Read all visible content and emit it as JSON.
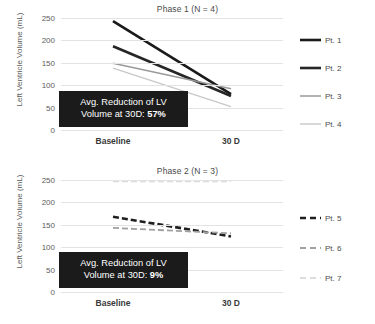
{
  "chart_data": [
    {
      "type": "line",
      "title": "Phase 1 (N = 4)",
      "xlabel": "",
      "ylabel": "Left Ventricle Volume (mL)",
      "categories": [
        "Baseline",
        "30 D"
      ],
      "ylim": [
        0,
        250
      ],
      "yticks": [
        0,
        50,
        100,
        150,
        200,
        250
      ],
      "grid": true,
      "legend_position": "right",
      "annotation": {
        "line1": "Avg. Reduction of LV",
        "line2_prefix": "Volume at 30D: ",
        "line2_value": "57%"
      },
      "series": [
        {
          "name": "Pt. 1",
          "values": [
            243,
            80
          ],
          "color": "#1a1a1a",
          "width": 2.6,
          "dash": "none"
        },
        {
          "name": "Pt. 2",
          "values": [
            187,
            76
          ],
          "color": "#262626",
          "width": 2.6,
          "dash": "none"
        },
        {
          "name": "Pt. 3",
          "values": [
            149,
            92
          ],
          "color": "#9a9a9a",
          "width": 1.5,
          "dash": "none"
        },
        {
          "name": "Pt. 4",
          "values": [
            138,
            52
          ],
          "color": "#c8c8c8",
          "width": 1.4,
          "dash": "none"
        }
      ]
    },
    {
      "type": "line",
      "title": "Phase 2 (N = 3)",
      "xlabel": "",
      "ylabel": "Left Ventricle Volume (mL)",
      "categories": [
        "Baseline",
        "30 D"
      ],
      "ylim": [
        0,
        250
      ],
      "yticks": [
        0,
        50,
        100,
        150,
        200,
        250
      ],
      "grid": true,
      "legend_position": "right",
      "annotation": {
        "line1": "Avg. Reduction of LV",
        "line2_prefix": "Volume at 30D: ",
        "line2_value": "9%"
      },
      "series": [
        {
          "name": "Pt. 5",
          "values": [
            168,
            124
          ],
          "color": "#1f1f1f",
          "width": 2.6,
          "dash": "6 3"
        },
        {
          "name": "Pt. 6",
          "values": [
            143,
            131
          ],
          "color": "#a0a0a0",
          "width": 1.8,
          "dash": "6 3"
        },
        {
          "name": "Pt. 7",
          "values": [
            247,
            247
          ],
          "color": "#dcdcdc",
          "width": 1.8,
          "dash": "6 3"
        }
      ]
    }
  ],
  "phase1": {
    "title": "Phase 1 (N = 4)",
    "ylabel": "Left Ventricle Volume (mL)",
    "yticks": [
      "250",
      "200",
      "150",
      "100",
      "50",
      "0"
    ],
    "xticks": [
      "Baseline",
      "30 D"
    ],
    "legend": [
      "Pt. 1",
      "Pt. 2",
      "Pt. 3",
      "Pt. 4"
    ],
    "callout_line1": "Avg. Reduction of LV",
    "callout_line2_prefix": "Volume at 30D: ",
    "callout_line2_value": "57%"
  },
  "phase2": {
    "title": "Phase 2 (N = 3)",
    "ylabel": "Left Ventricle Volume (mL)",
    "yticks": [
      "250",
      "200",
      "150",
      "100",
      "50",
      "0"
    ],
    "xticks": [
      "Baseline",
      "30 D"
    ],
    "legend": [
      "Pt. 5",
      "Pt. 6",
      "Pt. 7"
    ],
    "callout_line1": "Avg. Reduction of LV",
    "callout_line2_prefix": "Volume at 30D: ",
    "callout_line2_value": "9%"
  }
}
